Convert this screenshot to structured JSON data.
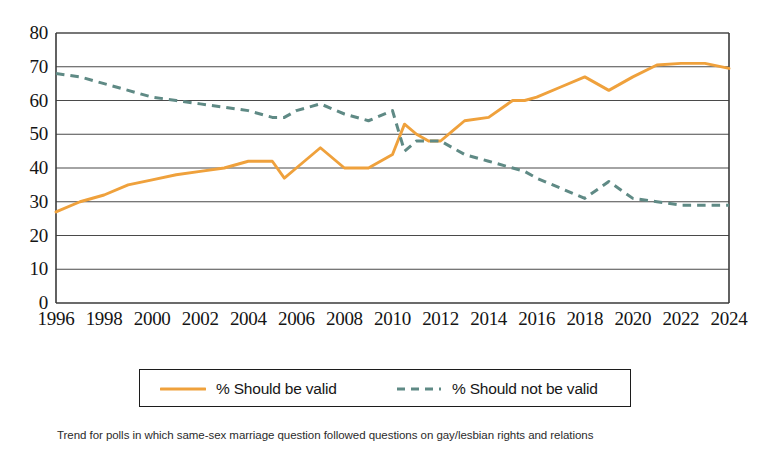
{
  "chart_data": {
    "type": "line",
    "title": "",
    "subtitle": "",
    "xlabel": "",
    "ylabel": "",
    "xlim": [
      1996,
      2024
    ],
    "ylim": [
      0,
      80
    ],
    "grid": "horizontal",
    "legend_position": "bottom",
    "yticks": [
      80,
      70,
      60,
      50,
      40,
      30,
      20,
      10,
      0
    ],
    "xticks": [
      1996,
      1998,
      2000,
      2002,
      2004,
      2006,
      2008,
      2010,
      2012,
      2014,
      2016,
      2018,
      2020,
      2022,
      2024
    ],
    "x": [
      1996,
      1997,
      1998,
      1999,
      2000,
      2001,
      2002,
      2003,
      2004,
      2005,
      2005.5,
      2006,
      2007,
      2008,
      2009,
      2010,
      2010.5,
      2011,
      2011.5,
      2012,
      2012.5,
      2013,
      2014,
      2015,
      2015.5,
      2016,
      2017,
      2018,
      2019,
      2020,
      2021,
      2022,
      2023,
      2024
    ],
    "series": [
      {
        "name": "% Should be valid",
        "color": "#efa13c",
        "style": "solid",
        "values": [
          27,
          30,
          32,
          35,
          36.5,
          38,
          39,
          40,
          42,
          42,
          37,
          40,
          46,
          40,
          40,
          44,
          53,
          50,
          48,
          48,
          51,
          54,
          55,
          60,
          60,
          61,
          64,
          67,
          63,
          67,
          70.5,
          71,
          71,
          69.5
        ]
      },
      {
        "name": "% Should not be valid",
        "color": "#5f8a85",
        "style": "dashed",
        "values": [
          68,
          67,
          65,
          63,
          61,
          60,
          59,
          58,
          57,
          55,
          55,
          57,
          59,
          56,
          54,
          57,
          45,
          48,
          48,
          48,
          46,
          44,
          42,
          40,
          39,
          37,
          34,
          31,
          36,
          31,
          30,
          29,
          29,
          29
        ]
      }
    ]
  },
  "legend": {
    "items": [
      {
        "label": "% Should be valid",
        "style": "solid",
        "color": "#efa13c"
      },
      {
        "label": "% Should not be valid",
        "style": "dashed",
        "color": "#5f8a85"
      }
    ]
  },
  "footnote": {
    "text": "Trend for polls in which same-sex marriage question followed questions on gay/lesbian rights and relations"
  },
  "colors": {
    "should_be_valid": "#efa13c",
    "should_not_be_valid": "#5f8a85",
    "axis": "#3a3a3a",
    "grid": "#4a4a4a",
    "text": "#141414",
    "background": "#ffffff"
  }
}
